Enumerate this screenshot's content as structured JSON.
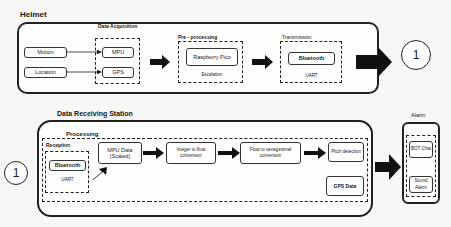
{
  "helmet": {
    "title": "Helmet",
    "inputs": [
      {
        "label": "Motion"
      },
      {
        "label": "Location"
      }
    ],
    "acquisition": {
      "title": "Data Acquisition",
      "items": [
        {
          "label": "MPU"
        },
        {
          "label": "GPS"
        }
      ]
    },
    "preprocessing": {
      "title": "Pre - processing",
      "node": "Raspberry Pico",
      "caption": "Escalation"
    },
    "transmission": {
      "title": "Transmission",
      "node": "Bluetooth",
      "caption": "UART"
    },
    "connector": "1"
  },
  "station": {
    "title": "Data Receiving Station",
    "connector": "1",
    "processing": {
      "title": "Processing",
      "reception": {
        "title": "Reception",
        "node": "Bluetooth",
        "caption": "UART"
      },
      "steps": [
        {
          "label": "MPU Data (Scaled)"
        },
        {
          "label": "Integer to float conversion"
        },
        {
          "label": "Float to sexagesimal conversion"
        },
        {
          "label": "Pitch detection"
        }
      ],
      "gps": "GPS Data"
    }
  },
  "alarm": {
    "title": "Alarm",
    "items": [
      {
        "label": "BOT Chat"
      },
      {
        "label": "Sound Alarm"
      }
    ]
  }
}
